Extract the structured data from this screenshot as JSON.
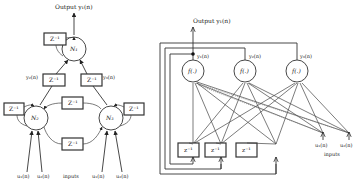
{
  "left_diagram": {
    "output_label": "Output y₁(n)",
    "nodes": [
      {
        "id": "N1",
        "label": "N₁"
      },
      {
        "id": "N2",
        "label": "N₂"
      },
      {
        "id": "N3",
        "label": "N₃"
      }
    ],
    "delay_label": "Z⁻¹",
    "signal_labels": {
      "y2": "y₂(n)",
      "y3": "y₃(n)"
    },
    "inputs": [
      "u₁(n)",
      "u₂(n)",
      "u₁(n)",
      "u₂(n)"
    ],
    "inputs_caption": "inputs"
  },
  "right_diagram": {
    "output_label": "Output y₁(n)",
    "neurons": [
      {
        "id": "f1",
        "label": "f(.)",
        "output": "y₁(n)"
      },
      {
        "id": "f2",
        "label": "f(.)",
        "output": "y₂(n)"
      },
      {
        "id": "f3",
        "label": "f(.)",
        "output": "y₃(n)"
      }
    ],
    "delay_label": "z⁻¹",
    "inputs": [
      "u₁(n)",
      "u₂(n)"
    ],
    "inputs_caption": "inputs"
  }
}
